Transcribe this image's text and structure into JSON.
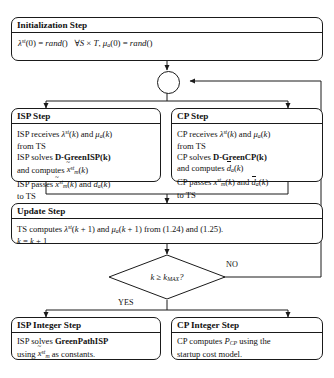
{
  "diagram": {
    "type": "flowchart",
    "nodes": {
      "initialization": {
        "title": "Initialization Step",
        "equation_plain": "λ^st(0) = rand()   ∀S × T, μ_a(0) = rand()",
        "shape": "rounded-rect"
      },
      "connector": {
        "label": "",
        "shape": "circle",
        "role": "loop-junction"
      },
      "isp_step": {
        "title": "ISP Step",
        "lines": [
          "ISP receives λ^st(k) and μ_a(k)",
          "from TS",
          "ISP solves D-GreenISP(k)",
          "and computes x̃^st_m(k)",
          "ISP passes x̃^st_m(k) and d_a(k)",
          "to TS"
        ],
        "shape": "rounded-rect"
      },
      "cp_step": {
        "title": "CP Step",
        "lines": [
          "CP receives λ^st(k) and μ_a(k)",
          "from TS",
          "CP solves D-GreenCP(k)",
          "and computes d̄_a(k)",
          "CP passes x^st_m(k) and d̄_a(k)",
          "to TS"
        ],
        "shape": "rounded-rect"
      },
      "update_step": {
        "title": "Update Step",
        "lines": [
          "TS computes λ^st(k + 1) and μ_a(k + 1) from (1.24) and (1.25).",
          "k = k + 1"
        ],
        "shape": "rounded-rect"
      },
      "decision": {
        "condition_plain": "k ≥ k_MAX ?",
        "shape": "diamond",
        "branch_no": "NO",
        "branch_yes": "YES"
      },
      "isp_integer_step": {
        "title": "ISP Integer Step",
        "lines": [
          "ISP solves GreenPathISP",
          "using x̃^st_m as constants."
        ],
        "shape": "rounded-rect"
      },
      "cp_integer_step": {
        "title": "CP Integer Step",
        "lines": [
          "CP computes P_CP using the",
          "startup cost model."
        ],
        "shape": "rounded-rect"
      }
    },
    "edges": [
      {
        "from": "initialization",
        "to": "connector",
        "label": ""
      },
      {
        "from": "connector",
        "to": "isp_step",
        "label": ""
      },
      {
        "from": "connector",
        "to": "cp_step",
        "label": ""
      },
      {
        "from": "isp_step",
        "to": "update_step",
        "label": ""
      },
      {
        "from": "cp_step",
        "to": "update_step",
        "label": ""
      },
      {
        "from": "update_step",
        "to": "decision",
        "label": ""
      },
      {
        "from": "decision",
        "to": "connector",
        "label": "NO"
      },
      {
        "from": "decision",
        "to": "isp_integer_step",
        "label": "YES"
      },
      {
        "from": "decision",
        "to": "cp_integer_step",
        "label": "YES"
      }
    ],
    "colors": {
      "stroke": "#1a1a1a",
      "fill": "#ffffff",
      "text": "#111111"
    }
  }
}
